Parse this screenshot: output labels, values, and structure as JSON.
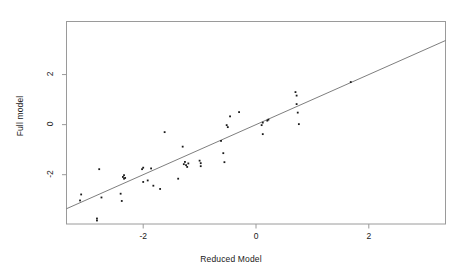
{
  "chart_data": {
    "type": "scatter",
    "title": "",
    "subtitle": "",
    "xlabel": "Reduced Model",
    "ylabel": "Full model",
    "xlim": [
      -3.36,
      3.36
    ],
    "ylim": [
      -3.97,
      4.12
    ],
    "xticks": [
      -2,
      0,
      2
    ],
    "xtick_labels": [
      "-2",
      "0",
      "2"
    ],
    "yticks": [
      -2,
      0,
      2
    ],
    "ytick_labels": [
      "-2",
      "0",
      "2"
    ],
    "grid": false,
    "legend": "none",
    "annotations": [
      {
        "name": "identity-line",
        "kind": "line",
        "description": "y = x reference line spanning the panel",
        "slope": 1,
        "intercept": 0
      }
    ],
    "series": [
      {
        "name": "observations",
        "marker": "square",
        "marker_size": 1.8,
        "color": "#1a1a1a",
        "points": [
          [
            -3.1,
            -2.79
          ],
          [
            -3.12,
            -3.03
          ],
          [
            -2.82,
            -3.75
          ],
          [
            -2.82,
            -3.83
          ],
          [
            -2.78,
            -1.78
          ],
          [
            -2.74,
            -2.91
          ],
          [
            -2.4,
            -2.76
          ],
          [
            -2.38,
            -3.05
          ],
          [
            -2.36,
            -2.09
          ],
          [
            -2.34,
            -2.16
          ],
          [
            -2.34,
            -2.02
          ],
          [
            -2.32,
            -2.13
          ],
          [
            -2.02,
            -1.78
          ],
          [
            -2.0,
            -1.72
          ],
          [
            -2.0,
            -2.29
          ],
          [
            -1.92,
            -2.23
          ],
          [
            -1.86,
            -1.75
          ],
          [
            -1.82,
            -2.44
          ],
          [
            -1.7,
            -2.57
          ],
          [
            -1.62,
            -0.3
          ],
          [
            -1.38,
            -2.16
          ],
          [
            -1.3,
            -0.88
          ],
          [
            -1.28,
            -1.58
          ],
          [
            -1.26,
            -1.49
          ],
          [
            -1.24,
            -1.62
          ],
          [
            -1.22,
            -1.69
          ],
          [
            -1.2,
            -1.55
          ],
          [
            -1.0,
            -1.44
          ],
          [
            -0.98,
            -1.54
          ],
          [
            -0.98,
            -1.66
          ],
          [
            -0.62,
            -0.65
          ],
          [
            -0.58,
            -1.14
          ],
          [
            -0.56,
            -1.5
          ],
          [
            -0.52,
            -0.02
          ],
          [
            -0.5,
            -0.1
          ],
          [
            -0.46,
            0.33
          ],
          [
            -0.3,
            0.5
          ],
          [
            0.1,
            -0.02
          ],
          [
            0.12,
            0.08
          ],
          [
            0.12,
            -0.38
          ],
          [
            0.2,
            0.16
          ],
          [
            0.22,
            0.2
          ],
          [
            0.7,
            1.3
          ],
          [
            0.72,
            1.16
          ],
          [
            0.72,
            0.82
          ],
          [
            0.74,
            0.48
          ],
          [
            0.76,
            0.02
          ],
          [
            1.68,
            1.7
          ]
        ]
      }
    ]
  },
  "axes": {
    "x_title": "Reduced Model",
    "y_title": "Full model",
    "x_tick_labels": [
      "-2",
      "0",
      "2"
    ],
    "y_tick_labels": [
      "2",
      "0",
      "-2"
    ]
  },
  "style": {
    "point_color": "#1a1a1a",
    "line_color": "#6f6f6f",
    "frame_color": "#9a9a9a",
    "background": "#ffffff"
  }
}
